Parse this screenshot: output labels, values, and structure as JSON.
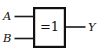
{
  "diagram": {
    "kind": "logic-gate-symbol",
    "symbol_standard": "IEC",
    "gate_type": "XOR",
    "background_color": "#ffffff",
    "line_color": "#111111",
    "body": {
      "operator_label": "=1",
      "fill_color": "#ffffff",
      "border_color": "#111111"
    },
    "inputs": [
      {
        "label": "A",
        "name": "input-a"
      },
      {
        "label": "B",
        "name": "input-b"
      }
    ],
    "output": {
      "label": "Y",
      "name": "output-y"
    }
  }
}
